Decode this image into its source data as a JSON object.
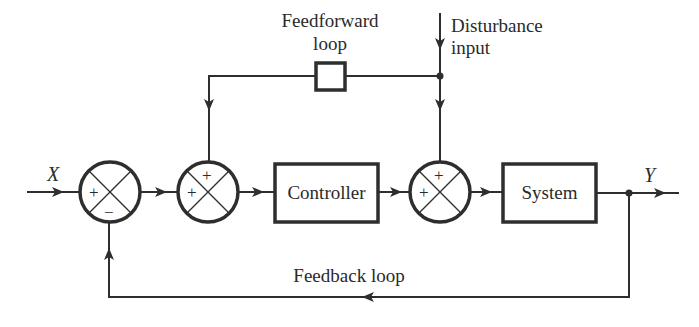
{
  "diagram": {
    "type": "control-block-diagram",
    "input_label": "X",
    "output_label": "Y",
    "feedforward": {
      "label_line1": "Feedforward",
      "label_line2": "loop"
    },
    "disturbance": {
      "label_line1": "Disturbance",
      "label_line2": "input"
    },
    "feedback": {
      "label": "Feedback loop"
    },
    "blocks": [
      {
        "id": "controller",
        "label": "Controller"
      },
      {
        "id": "system",
        "label": "System"
      },
      {
        "id": "feedforward-block",
        "label": ""
      }
    ],
    "summing_junctions": [
      {
        "id": "sum1",
        "signs": {
          "left": "+",
          "bottom": "−"
        }
      },
      {
        "id": "sum2",
        "signs": {
          "left": "+",
          "top": "+"
        }
      },
      {
        "id": "sum3",
        "signs": {
          "left": "+",
          "top": "+"
        }
      }
    ],
    "colors": {
      "stroke": "#2e2e2e",
      "background": "#ffffff"
    }
  }
}
